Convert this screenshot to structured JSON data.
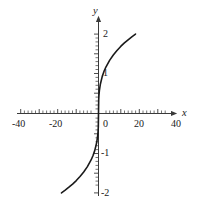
{
  "chart_data": {
    "type": "line",
    "title": "",
    "xlabel": "x",
    "ylabel": "y",
    "xlim": [
      -45,
      45
    ],
    "ylim": [
      -2.35,
      2.35
    ],
    "grid": false,
    "legend": null,
    "x_ticks": [
      -40,
      -20,
      0,
      20,
      40
    ],
    "x_tick_labels": [
      "-40",
      "-20",
      "0",
      "20",
      "40"
    ],
    "y_ticks": [
      -2,
      -1,
      1,
      2
    ],
    "y_tick_labels": [
      "-2",
      "-1",
      "1",
      "2"
    ],
    "x_minor_step": 4,
    "y_minor_step": 0.2,
    "series": [
      {
        "name": "cube-root curve",
        "color": "#1a1a1a",
        "linewidth": 1.6,
        "x": [
          -40,
          -36,
          -32,
          -28,
          -24,
          -20,
          -16,
          -12,
          -8,
          -6,
          -4,
          -2,
          -1,
          -0.5,
          -0.2,
          0,
          0.2,
          0.5,
          1,
          2,
          4,
          6,
          8,
          12,
          16,
          20,
          24,
          28,
          32,
          36,
          40
        ],
        "y": [
          -2.0,
          -1.931,
          -1.857,
          -1.777,
          -1.689,
          -1.587,
          -1.473,
          -1.339,
          -1.17,
          -1.063,
          -0.929,
          -0.737,
          -0.585,
          -0.464,
          -0.342,
          0,
          0.342,
          0.464,
          0.585,
          0.737,
          0.929,
          1.063,
          1.17,
          1.339,
          1.473,
          1.587,
          1.689,
          1.777,
          1.857,
          1.931,
          2.0
        ]
      }
    ]
  },
  "axes": {
    "x_axis_name": "x",
    "y_axis_name": "y",
    "origin_label": "0"
  },
  "labels": {
    "x_neg40": "-40",
    "x_neg20": "-20",
    "x_zero": "0",
    "x_20": "20",
    "x_40": "40",
    "y_2": "2",
    "y_1": "1",
    "y_neg1": "-1",
    "y_neg2": "-2"
  },
  "colors": {
    "curve": "#1a1a1a",
    "axis": "#3a3a3a",
    "background": "#ffffff"
  }
}
